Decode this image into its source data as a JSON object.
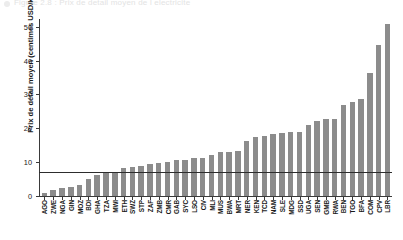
{
  "figure": {
    "cropped_title_ghost": "Figure 2.8 : Prix de detail moyen de l electricite",
    "bar_color": "#8c8c8c",
    "axis_color": "#3a3a3a",
    "reference_line_color": "#2d2d2d"
  },
  "chart_data": {
    "type": "bar",
    "title": "",
    "xlabel": "",
    "ylabel": "Prix de détail moyen (centimes USD/kWh)",
    "ylim": [
      0,
      52
    ],
    "yticks": [
      0,
      10,
      20,
      30,
      40,
      50
    ],
    "ytick_labels": [
      "0",
      "10",
      "20",
      "30",
      "40",
      "50"
    ],
    "grid": false,
    "legend": "none",
    "reference_line": {
      "value": 7.2,
      "orientation": "horizontal",
      "label": ""
    },
    "categories": [
      "AGO",
      "ZWE",
      "NGA",
      "GIN",
      "MOZ",
      "BDI",
      "GHA",
      "TZA",
      "MWI",
      "ETH",
      "SWZ",
      "STP",
      "ZAF",
      "ZMB",
      "CMR",
      "GAB",
      "SYC",
      "LSO",
      "CIV",
      "MLI",
      "MUS",
      "BWA",
      "MRT",
      "NER",
      "KEN",
      "TCD",
      "NAM",
      "SLE",
      "MDG",
      "SSD",
      "UGA",
      "SEN",
      "GMB",
      "RWA",
      "BEN",
      "TGO",
      "BFA",
      "COM",
      "CPV",
      "LBR"
    ],
    "values": [
      1.0,
      1.8,
      2.4,
      2.7,
      3.2,
      5.1,
      6.2,
      7.1,
      7.1,
      8.3,
      8.5,
      8.9,
      9.4,
      9.8,
      10.0,
      10.5,
      10.7,
      11.2,
      11.3,
      12.1,
      12.9,
      13.0,
      13.2,
      16.3,
      17.4,
      17.6,
      18.2,
      18.5,
      18.8,
      18.8,
      21.0,
      22.2,
      22.7,
      22.8,
      27.0,
      27.8,
      28.7,
      36.2,
      44.7,
      50.8
    ]
  }
}
